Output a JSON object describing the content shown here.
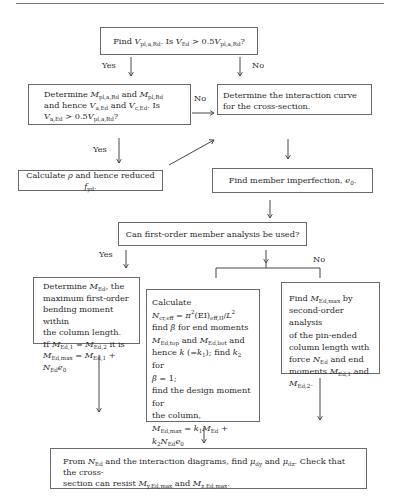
{
  "diagram": {
    "type": "flowchart",
    "nodes": {
      "find_vpl": {
        "text": "Find Vpl,a,Rd. Is VEd > 0.5Vpl,a,Rd?"
      },
      "determine_mpl": {
        "text": "Determine Mpl,a,Rd and Mpl,Rd and hence Va,Ed and Vc,Ed. Is Va,Ed > 0.5Vpl,a,Rd?"
      },
      "interaction_curve": {
        "text": "Determine the interaction curve for the cross-section."
      },
      "calc_rho": {
        "text": "Calculate ρ and hence reduced fyd."
      },
      "imperfection": {
        "text": "Find member imperfection, e0."
      },
      "first_order": {
        "text": "Can first-order member analysis be used?"
      },
      "first_order_yes": {
        "text": "Determine MEd, the maximum first-order bending moment within the column length. If MEd,1 = MEd,2 it is MEd,max = MEd,1 + NEd e0"
      },
      "calculate_ncr": {
        "text": "Calculate Ncr,eff = π²(EI)eff,II/L² find β for end moments MEd,top and MEd,bot and hence k (=k1); find k2 for β = 1; find the design moment for the column, MEd,max = k1MEd + k2NEde0"
      },
      "second_order": {
        "text": "Find MEd,max by second-order analysis of the pin-ended column length with force NEd and end moments MEd,1 and MEd,2."
      },
      "final_check": {
        "text": "From NEd and the interaction diagrams, find μdy and μdz. Check that the cross-section can resist My,Ed,max and Mz,Ed,max."
      }
    },
    "labels": {
      "yes1": "Yes",
      "no1": "No",
      "no2": "No",
      "yes2": "Yes",
      "yes3": "Yes",
      "no3": "No"
    },
    "text_parts": {
      "find": "Find",
      "is": ". Is",
      "gt05": "> 0.5",
      "q": "?",
      "determine": "Determine",
      "and": "and",
      "and_sp": " and",
      "hence": "hence",
      "is2": ". Is",
      "gt": " >",
      "half": "0.5",
      "interaction": "Determine the interaction curve for the cross-section.",
      "calc_a": "Calculate",
      "calc_b": "and hence reduced",
      "dot": ".",
      "imperf": "Find member imperfection,",
      "firstorder": "Can first-order member analysis be used?",
      "l1": "Determine",
      "l1b": ", the",
      "l2": "maximum first-order",
      "l3": "bending moment within",
      "l4": "the column length.",
      "l5": "If",
      "l5b": "it is",
      "m1": "Calculate",
      "m3": "find",
      "m3b": "for end moments",
      "m4b": "and",
      "m5a": "hence",
      "m5b": "; find",
      "m5c": "for",
      "m6b": "= 1;",
      "m7": "find the design moment for",
      "m8": "the column,",
      "r1": "Find",
      "r1b": "by",
      "r2": "second-order analysis",
      "r3": "of the pin-ended",
      "r4": "column length with",
      "r5": "force",
      "r5b": "and end",
      "r6": "moments",
      "r6b": "and",
      "b1": "From",
      "b1b": "and the interaction diagrams, find",
      "b1c": "and",
      "b1d": ". Check that the cross-",
      "b2": "section can resist",
      "b2b": "and"
    }
  }
}
